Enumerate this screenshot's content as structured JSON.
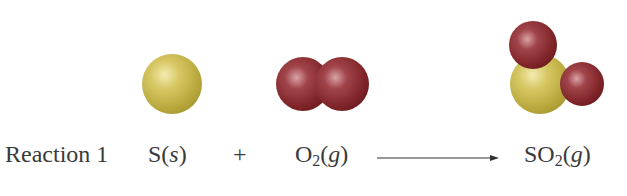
{
  "diagram": {
    "title": "Reaction 1",
    "equation": {
      "reactants": [
        {
          "formula": "S",
          "subscript": "",
          "state": "s"
        },
        {
          "formula": "O",
          "subscript": "2",
          "state": "g"
        }
      ],
      "operator": "+",
      "arrow": "→",
      "products": [
        {
          "formula": "SO",
          "subscript": "2",
          "state": "g"
        }
      ]
    },
    "molecules": [
      {
        "name": "sulfur-atom",
        "atoms": [
          "S"
        ]
      },
      {
        "name": "oxygen-molecule",
        "atoms": [
          "O",
          "O"
        ]
      },
      {
        "name": "sulfur-dioxide-molecule",
        "atoms": [
          "O",
          "S",
          "O"
        ]
      }
    ],
    "colors": {
      "sulfur": "#c9b94a",
      "oxygen": "#8a2a2e",
      "text": "#3a3a3a",
      "background": "#ffffff"
    }
  },
  "paren_open": "(",
  "paren_close": ")"
}
